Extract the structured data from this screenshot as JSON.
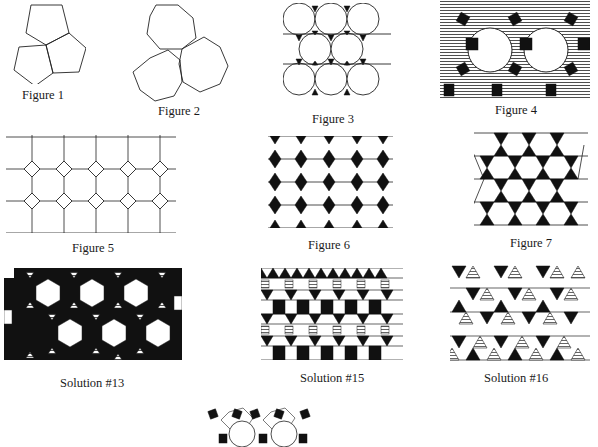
{
  "page": {
    "type": "tiling-figures-plate",
    "background": "#ffffff",
    "ink_color": "#111111"
  },
  "figures": [
    {
      "id": "fig1",
      "caption": "Figure 1",
      "description": "Three regular pentagons meeting at a vertex, leaving a gap"
    },
    {
      "id": "fig2",
      "caption": "Figure 2",
      "description": "Three regular octagons, two touching and one separated"
    },
    {
      "id": "fig3",
      "caption": "Figure 3",
      "description": "Tiling of dodecagons with black triangles between them"
    },
    {
      "id": "fig4",
      "caption": "Figure 4",
      "description": "Tiling of dodecagons, black squares and horizontally hatched hexagons"
    },
    {
      "id": "fig5",
      "caption": "Figure 5",
      "description": "Octagon and square tiling (4.8.8)"
    },
    {
      "id": "fig6",
      "caption": "Figure 6",
      "description": "Columns of black rhombi/triangles between white hexagons"
    },
    {
      "id": "fig7",
      "caption": "Figure 7",
      "description": "Trihexagonal tiling with black triangles and white hexagons"
    },
    {
      "id": "sol13",
      "caption": "Solution #13",
      "description": "Hexagons, black squares and hatched triangles"
    },
    {
      "id": "sol15",
      "caption": "Solution #15",
      "description": "Rows of squares, triangles with black and hatched fills"
    },
    {
      "id": "sol16",
      "caption": "Solution #16",
      "description": "Hexagons and triangles, black and hatched triangles"
    },
    {
      "id": "sol17",
      "caption": "",
      "description": "Partially visible tiling of dodecagons, black squares and small triangles"
    }
  ]
}
